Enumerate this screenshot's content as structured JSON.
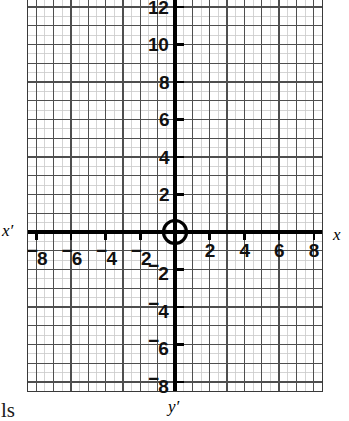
{
  "figure": {
    "corner_fragment": "ls"
  },
  "axis_labels": {
    "x_positive": "x",
    "x_negative": "x′",
    "y_negative": "y′"
  },
  "colors": {
    "background": "#ffffff",
    "minor_grid": "#c8c8c8",
    "major_grid": "#4a4a4a",
    "axis": "#000000",
    "text": "#111111"
  },
  "chart_data": {
    "type": "scatter",
    "title": "",
    "xlabel": "x",
    "ylabel": "y",
    "grid": true,
    "legend": null,
    "xlim": [
      -8.5,
      8.5
    ],
    "ylim": [
      -8.5,
      12.5
    ],
    "x_major_step": 1,
    "x_minor_step": 0.5,
    "y_major_step": 1,
    "y_minor_step": 0.5,
    "x_tick_values": [
      -8,
      -6,
      -4,
      -2,
      2,
      4,
      6,
      8
    ],
    "y_tick_values": [
      12,
      10,
      8,
      6,
      4,
      2,
      -2,
      -4,
      -6,
      -8
    ],
    "x_tick_labels": [
      "‒8",
      "‒6",
      "‒4",
      "‒2",
      "2",
      "4",
      "6",
      "8"
    ],
    "y_tick_labels": [
      "12",
      "10",
      "8",
      "6",
      "4",
      "2",
      "‒2",
      "‒4",
      "‒6",
      "‒8"
    ],
    "series": [],
    "x": [],
    "values": [],
    "annotations": [
      {
        "name": "origin-marker",
        "shape": "open-circle",
        "x": 0,
        "y": 0,
        "label": ""
      }
    ]
  },
  "x_ticks": [
    {
      "value": -8,
      "sign": "−",
      "digits": "8"
    },
    {
      "value": -6,
      "sign": "−",
      "digits": "6"
    },
    {
      "value": -4,
      "sign": "−",
      "digits": "4"
    },
    {
      "value": -2,
      "sign": "−",
      "digits": "2"
    },
    {
      "value": 2,
      "sign": "",
      "digits": "2"
    },
    {
      "value": 4,
      "sign": "",
      "digits": "4"
    },
    {
      "value": 6,
      "sign": "",
      "digits": "6"
    },
    {
      "value": 8,
      "sign": "",
      "digits": "8"
    }
  ],
  "y_ticks": [
    {
      "value": 12,
      "sign": "",
      "digits": "12"
    },
    {
      "value": 10,
      "sign": "",
      "digits": "10"
    },
    {
      "value": 8,
      "sign": "",
      "digits": "8"
    },
    {
      "value": 6,
      "sign": "",
      "digits": "6"
    },
    {
      "value": 4,
      "sign": "",
      "digits": "4"
    },
    {
      "value": 2,
      "sign": "",
      "digits": "2"
    },
    {
      "value": -2,
      "sign": "−",
      "digits": "2"
    },
    {
      "value": -4,
      "sign": "−",
      "digits": "4"
    },
    {
      "value": -6,
      "sign": "−",
      "digits": "6"
    },
    {
      "value": -8,
      "sign": "−",
      "digits": "8"
    }
  ]
}
